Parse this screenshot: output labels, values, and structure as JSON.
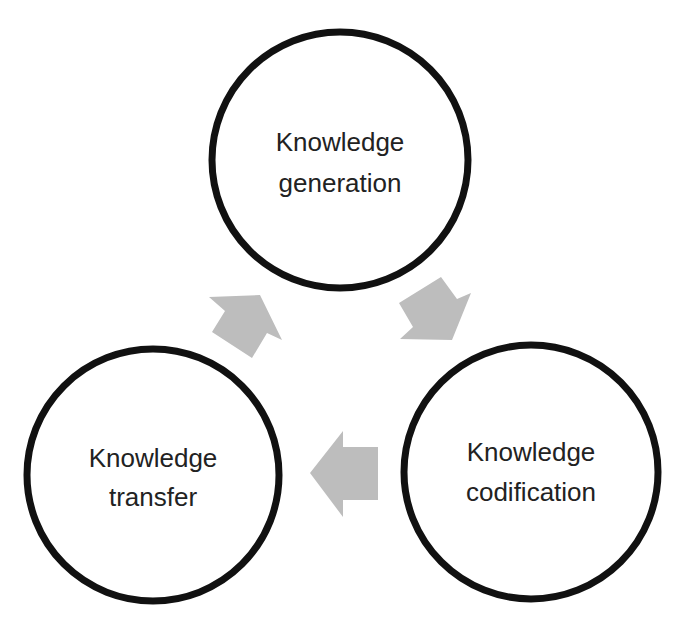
{
  "diagram": {
    "title": "",
    "type": "cycle",
    "background_color": "#ffffff",
    "circle_stroke_color": "#111111",
    "arrow_color": "#bdbdbd",
    "text_color": "#222222",
    "nodes": [
      {
        "id": "generation",
        "line1": "Knowledge",
        "line2": "generation"
      },
      {
        "id": "codification",
        "line1": "Knowledge",
        "line2": "codification"
      },
      {
        "id": "transfer",
        "line1": "Knowledge",
        "line2": "transfer"
      }
    ],
    "flows": [
      {
        "from": "generation",
        "to": "codification",
        "icon": "arrow-down-right-icon"
      },
      {
        "from": "codification",
        "to": "transfer",
        "icon": "arrow-left-icon"
      },
      {
        "from": "transfer",
        "to": "generation",
        "icon": "arrow-up-right-icon"
      }
    ]
  }
}
